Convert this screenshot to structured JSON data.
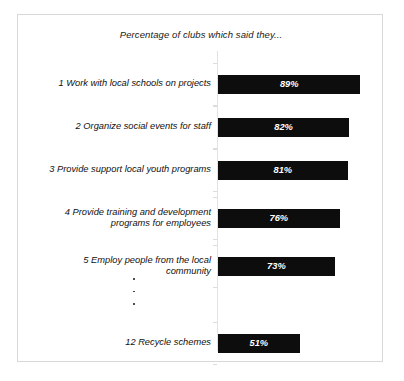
{
  "chart_data": {
    "type": "bar",
    "orientation": "horizontal",
    "title": "Percentage of clubs which said they...",
    "xlabel": "",
    "ylabel": "",
    "xlim": [
      0,
      100
    ],
    "grid": false,
    "legend": null,
    "value_suffix": "%",
    "categories": [
      "1 Work with local schools on projects",
      "2 Organize social events for staff",
      "3 Provide support local youth programs",
      "4 Provide training and development programs for employees",
      "5 Employ people from the local community",
      "12 Recycle schemes"
    ],
    "values": [
      89,
      82,
      81,
      76,
      73,
      51
    ],
    "annotations": [
      "vertical-ellipsis between rank 5 and rank 12"
    ]
  },
  "figure": {
    "title": "Percentage of clubs which said they...",
    "ellipsis_dots": 3,
    "bars": [
      {
        "rank": "1",
        "label_lines": [
          "1 Work with local schools on projects"
        ],
        "value": 89,
        "value_label": "89%"
      },
      {
        "rank": "2",
        "label_lines": [
          "2 Organize social events for staff"
        ],
        "value": 82,
        "value_label": "82%"
      },
      {
        "rank": "3",
        "label_lines": [
          "3 Provide support local youth programs"
        ],
        "value": 81,
        "value_label": "81%"
      },
      {
        "rank": "4",
        "label_lines": [
          "4 Provide training and development",
          "programs for employees"
        ],
        "value": 76,
        "value_label": "76%"
      },
      {
        "rank": "5",
        "label_lines": [
          "5 Employ people from the local",
          "community"
        ],
        "value": 73,
        "value_label": "73%"
      },
      {
        "rank": "12",
        "label_lines": [
          "12 Recycle schemes"
        ],
        "value": 51,
        "value_label": "51%"
      }
    ],
    "colors": {
      "bar": "#0d0d0d",
      "value_text": "#ffffff",
      "label_text": "#111111",
      "axis": "#e2e2e2",
      "frame": "#d8d8d8",
      "background": "#ffffff"
    }
  }
}
